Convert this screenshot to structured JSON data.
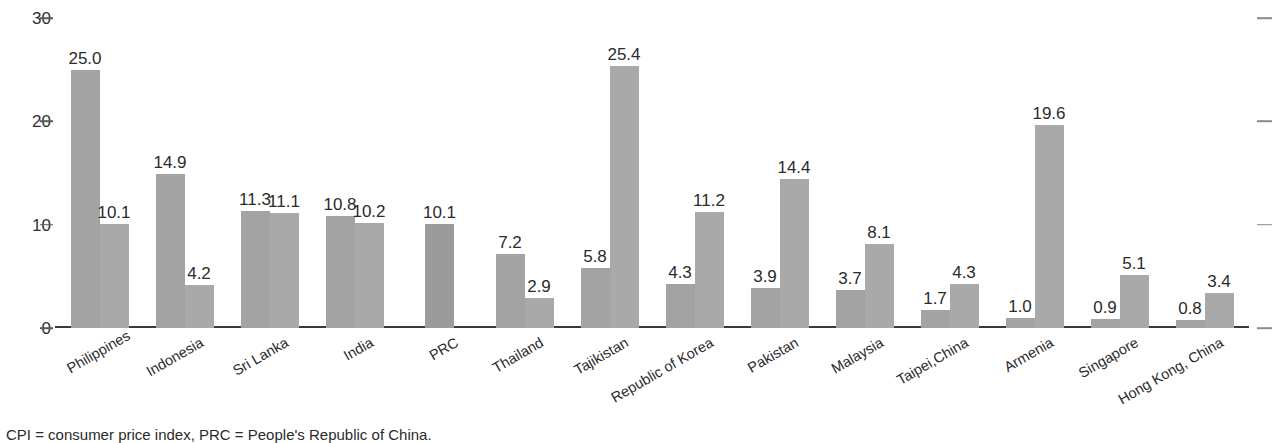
{
  "chart_data": {
    "type": "bar",
    "title": "",
    "subtitle": "",
    "xlabel": "",
    "ylabel": "",
    "ylim": [
      0,
      30
    ],
    "yticks": [
      0,
      10,
      20,
      30
    ],
    "ytick_labels": [
      "0",
      "10",
      "20",
      "30"
    ],
    "grid": false,
    "legend": "none",
    "right_axis_ticks": [
      0,
      10,
      20,
      30
    ],
    "categories": [
      "Philippines",
      "Indonesia",
      "Sri Lanka",
      "India",
      "PRC",
      "Thailand",
      "Tajikistan",
      "Republic of Korea",
      "Pakistan",
      "Malaysia",
      "Taipei,China",
      "Armenia",
      "Singapore",
      "Hong Kong, China"
    ],
    "series": [
      {
        "name": "series-a",
        "values": [
          25.0,
          14.9,
          11.3,
          10.8,
          10.1,
          7.2,
          5.8,
          4.3,
          3.9,
          3.7,
          1.7,
          1.0,
          0.9,
          0.8
        ]
      },
      {
        "name": "series-b",
        "values": [
          10.1,
          4.2,
          11.1,
          10.2,
          null,
          2.9,
          25.4,
          11.2,
          14.4,
          8.1,
          4.3,
          19.6,
          5.1,
          3.4
        ]
      }
    ],
    "data_labels": [
      [
        "25.0",
        "10.1"
      ],
      [
        "14.9",
        "4.2"
      ],
      [
        "11.3",
        "11.1"
      ],
      [
        "10.8",
        "10.2"
      ],
      [
        "10.1",
        null
      ],
      [
        "7.2",
        "2.9"
      ],
      [
        "5.8",
        "25.4"
      ],
      [
        "4.3",
        "11.2"
      ],
      [
        "3.9",
        "14.4"
      ],
      [
        "3.7",
        "8.1"
      ],
      [
        "1.7",
        "4.3"
      ],
      [
        "1.0",
        "19.6"
      ],
      [
        "0.9",
        "5.1"
      ],
      [
        "0.8",
        "3.4"
      ]
    ],
    "colors": {
      "series_a": "#a3a3a3",
      "series_b": "#a9a9a9",
      "axis": "#3a3a3a",
      "text": "#2b2b2b"
    }
  },
  "footnote": "CPI = consumer price index, PRC = People's Republic of China."
}
